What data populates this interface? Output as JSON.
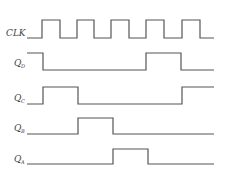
{
  "diagram": {
    "type": "timing-diagram",
    "colors": {
      "background": "#ffffff",
      "line": "#555555",
      "text": "#444444"
    },
    "signals": [
      {
        "name": "CLK",
        "label_main": "CLK",
        "label_sub": "",
        "label_x": 6,
        "label_y": 36,
        "high_y": 20,
        "low_y": 38,
        "points": "27,38 42,38 42,20 60,20 60,38 77,38 77,20 94,20 94,38 111,38 111,20 129,20 129,38 146,38 146,20 164,20 164,38 182,38 182,20 200,20 200,38 214,38"
      },
      {
        "name": "Q_D",
        "label_main": "Q",
        "label_sub": "D",
        "label_x": 14,
        "label_y": 66,
        "high_y": 53,
        "low_y": 70,
        "points": "27,53 43,53 43,70 146,70 146,53 181,53 181,70 214,70"
      },
      {
        "name": "Q_C",
        "label_main": "Q",
        "label_sub": "C",
        "label_x": 14,
        "label_y": 101,
        "high_y": 87,
        "low_y": 104,
        "points": "27,104 43,104 43,87 78,87 78,104 182,104 182,87 214,87"
      },
      {
        "name": "Q_B",
        "label_main": "Q",
        "label_sub": "B",
        "label_x": 14,
        "label_y": 131,
        "high_y": 118,
        "low_y": 134,
        "points": "27,134 78,134 78,118 113,118 113,134 214,134"
      },
      {
        "name": "Q_A",
        "label_main": "Q",
        "label_sub": "A",
        "label_x": 14,
        "label_y": 162,
        "high_y": 149,
        "low_y": 164,
        "points": "27,164 113,164 113,149 148,149 148,164 214,164"
      }
    ]
  }
}
